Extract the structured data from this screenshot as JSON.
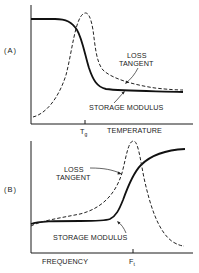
{
  "figure": {
    "panels": [
      {
        "id": "A",
        "label": "(A)",
        "x_axis_label": "TEMPERATURE",
        "tick_label_main": "T",
        "tick_label_sub": "g",
        "curves": [
          {
            "name": "loss_tangent",
            "label_line1": "LOSS",
            "label_line2": "TANGENT",
            "style": "dashed"
          },
          {
            "name": "storage_modulus",
            "label": "STORAGE MODULUS",
            "style": "solid"
          }
        ]
      },
      {
        "id": "B",
        "label": "(B)",
        "x_axis_label": "FREQUENCY",
        "tick_label_main": "F",
        "tick_label_sub": "t",
        "curves": [
          {
            "name": "loss_tangent",
            "label_line1": "LOSS",
            "label_line2": "TANGENT",
            "style": "dashed"
          },
          {
            "name": "storage_modulus",
            "label": "STORAGE MODULUS",
            "style": "solid"
          }
        ]
      }
    ]
  }
}
